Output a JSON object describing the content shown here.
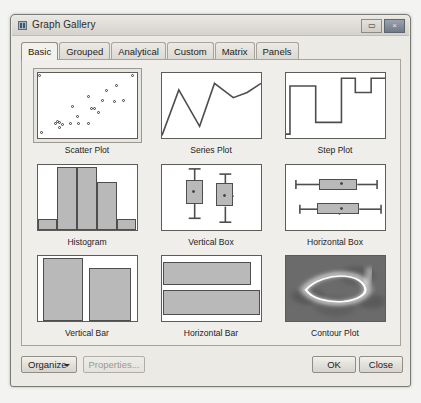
{
  "window": {
    "title": "Graph Gallery",
    "icon": "app-window-icon",
    "controls": [
      {
        "name": "restore-button",
        "glyph": "▭"
      },
      {
        "name": "close-button",
        "glyph": "×"
      }
    ]
  },
  "tabs": [
    {
      "label": "Basic",
      "selected": true
    },
    {
      "label": "Grouped",
      "selected": false
    },
    {
      "label": "Analytical",
      "selected": false
    },
    {
      "label": "Custom",
      "selected": false
    },
    {
      "label": "Matrix",
      "selected": false
    },
    {
      "label": "Panels",
      "selected": false
    }
  ],
  "gallery": {
    "items": [
      {
        "label": "Scatter Plot",
        "kind": "scatter",
        "selected": true
      },
      {
        "label": "Series Plot",
        "kind": "series",
        "selected": false
      },
      {
        "label": "Step Plot",
        "kind": "step",
        "selected": false
      },
      {
        "label": "Histogram",
        "kind": "histogram",
        "selected": false
      },
      {
        "label": "Vertical Box",
        "kind": "vbox",
        "selected": false
      },
      {
        "label": "Horizontal Box",
        "kind": "hbox",
        "selected": false
      },
      {
        "label": "Vertical Bar",
        "kind": "vbar",
        "selected": false
      },
      {
        "label": "Horizontal Bar",
        "kind": "hbar",
        "selected": false
      },
      {
        "label": "Contour Plot",
        "kind": "contour",
        "selected": false
      }
    ]
  },
  "buttons": {
    "organize": "Organize",
    "properties": "Properties...",
    "ok": "OK",
    "close": "Close"
  },
  "colors": {
    "fill": "#b9b9b9",
    "stroke": "#4e4e4e",
    "panel": "#f0eeea",
    "frame": "#eceae4"
  },
  "chart_data": {
    "scatter": {
      "type": "scatter",
      "points": [
        [
          3,
          96
        ],
        [
          5,
          8
        ],
        [
          96,
          96
        ],
        [
          19,
          22
        ],
        [
          21,
          24
        ],
        [
          23,
          23
        ],
        [
          26,
          20
        ],
        [
          23,
          15
        ],
        [
          34,
          21
        ],
        [
          42,
          21
        ],
        [
          52,
          22
        ],
        [
          41,
          33
        ],
        [
          36,
          47
        ],
        [
          55,
          45
        ],
        [
          58,
          44
        ],
        [
          62,
          38
        ],
        [
          52,
          63
        ],
        [
          66,
          57
        ],
        [
          78,
          56
        ],
        [
          87,
          57
        ],
        [
          70,
          73
        ],
        [
          80,
          80
        ]
      ]
    },
    "series": {
      "type": "line",
      "x": [
        0,
        17,
        38,
        53,
        72,
        86,
        100
      ],
      "y": [
        4,
        74,
        18,
        84,
        62,
        70,
        84
      ]
    },
    "step": {
      "type": "step",
      "x": [
        0,
        4,
        4,
        30,
        30,
        56,
        56,
        70,
        70,
        86,
        86,
        100
      ],
      "y": [
        6,
        6,
        80,
        80,
        24,
        24,
        92,
        92,
        70,
        70,
        92,
        92
      ]
    },
    "histogram": {
      "type": "bar",
      "categories": [
        "1",
        "2",
        "3",
        "4",
        "5"
      ],
      "values": [
        16,
        96,
        96,
        74,
        16
      ]
    },
    "vbox": {
      "type": "box",
      "boxes": [
        {
          "min": 18,
          "q1": 40,
          "median": 58,
          "q3": 76,
          "max": 94
        },
        {
          "min": 12,
          "q1": 36,
          "median": 52,
          "q3": 72,
          "max": 86
        }
      ]
    },
    "hbox": {
      "type": "box",
      "boxes": [
        {
          "min": 10,
          "q1": 34,
          "median": 66,
          "q3": 72,
          "max": 92
        },
        {
          "min": 14,
          "q1": 32,
          "median": 54,
          "q3": 74,
          "max": 96
        }
      ]
    },
    "vbar": {
      "type": "bar",
      "categories": [
        "A",
        "B"
      ],
      "values": [
        97,
        82
      ]
    },
    "hbar": {
      "type": "bar",
      "categories": [
        "A",
        "B"
      ],
      "values": [
        88,
        98
      ]
    },
    "contour": {
      "type": "heatmap",
      "description": "dark grayscale density surface with bright irregular closed ring"
    }
  }
}
